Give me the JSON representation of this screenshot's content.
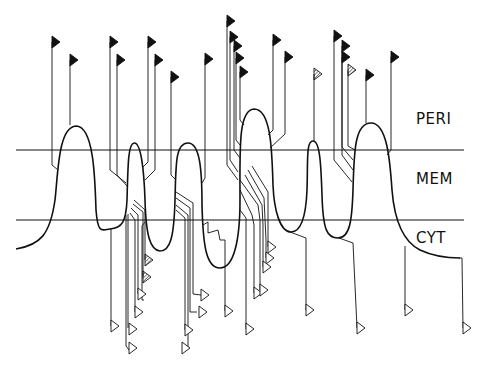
{
  "regions": {
    "peri": "PERI",
    "mem": "MEM",
    "cyt": "CYT"
  },
  "colors": {
    "line": "#111111",
    "background": "#ffffff"
  },
  "membrane": {
    "top_y": 150,
    "bottom_y": 220
  },
  "top_flags": [
    {
      "x": 52,
      "y": 42,
      "fill": "solid"
    },
    {
      "x": 70,
      "y": 60,
      "fill": "solid"
    },
    {
      "x": 110,
      "y": 42,
      "fill": "solid"
    },
    {
      "x": 117,
      "y": 60,
      "fill": "solid"
    },
    {
      "x": 148,
      "y": 42,
      "fill": "solid"
    },
    {
      "x": 155,
      "y": 60,
      "fill": "solid"
    },
    {
      "x": 171,
      "y": 77,
      "fill": "solid"
    },
    {
      "x": 205,
      "y": 59,
      "fill": "solid"
    },
    {
      "x": 227,
      "y": 21,
      "fill": "solid"
    },
    {
      "x": 230,
      "y": 37,
      "fill": "solid"
    },
    {
      "x": 234,
      "y": 46,
      "fill": "solid"
    },
    {
      "x": 236,
      "y": 58,
      "fill": "solid"
    },
    {
      "x": 240,
      "y": 72,
      "fill": "solid"
    },
    {
      "x": 273,
      "y": 40,
      "fill": "solid"
    },
    {
      "x": 285,
      "y": 57,
      "fill": "solid"
    },
    {
      "x": 314,
      "y": 74,
      "fill": "hatched"
    },
    {
      "x": 334,
      "y": 36,
      "fill": "solid"
    },
    {
      "x": 342,
      "y": 46,
      "fill": "solid"
    },
    {
      "x": 342,
      "y": 57,
      "fill": "solid"
    },
    {
      "x": 348,
      "y": 70,
      "fill": "hatched"
    },
    {
      "x": 366,
      "y": 75,
      "fill": "solid"
    },
    {
      "x": 391,
      "y": 57,
      "fill": "solid"
    }
  ],
  "bottom_flags": [
    {
      "x": 146,
      "y": 260,
      "fill": "hatched"
    },
    {
      "x": 144,
      "y": 277,
      "fill": "hatched"
    },
    {
      "x": 139,
      "y": 294,
      "fill": "open"
    },
    {
      "x": 136,
      "y": 312,
      "fill": "open"
    },
    {
      "x": 116,
      "y": 327,
      "fill": "open"
    },
    {
      "x": 132,
      "y": 329,
      "fill": "open"
    },
    {
      "x": 131,
      "y": 348,
      "fill": "open"
    },
    {
      "x": 180,
      "y": 330,
      "fill": "open"
    },
    {
      "x": 183,
      "y": 348,
      "fill": "open"
    },
    {
      "x": 199,
      "y": 312,
      "fill": "open"
    },
    {
      "x": 203,
      "y": 295,
      "fill": "open"
    },
    {
      "x": 225,
      "y": 311,
      "fill": "open"
    },
    {
      "x": 254,
      "y": 293,
      "fill": "open"
    },
    {
      "x": 265,
      "y": 247,
      "fill": "open"
    },
    {
      "x": 267,
      "y": 258,
      "fill": "open"
    },
    {
      "x": 263,
      "y": 267,
      "fill": "open"
    },
    {
      "x": 260,
      "y": 290,
      "fill": "open"
    },
    {
      "x": 306,
      "y": 310,
      "fill": "open"
    },
    {
      "x": 246,
      "y": 329,
      "fill": "open"
    },
    {
      "x": 357,
      "y": 328,
      "fill": "open"
    },
    {
      "x": 407,
      "y": 310,
      "fill": "open"
    },
    {
      "x": 463,
      "y": 328,
      "fill": "open"
    }
  ]
}
